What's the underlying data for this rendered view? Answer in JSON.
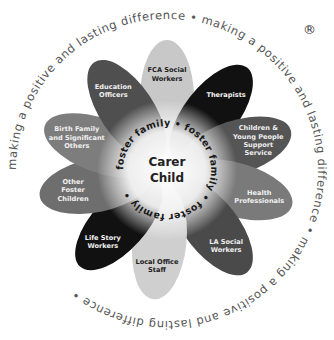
{
  "diagram": {
    "ring_text": "making a positive and lasting difference • making a positive and lasting difference • making a positive and lasting difference •",
    "inner_ring_text": "foster family • foster family • foster family •",
    "center": {
      "line1": "Carer",
      "line2": "Child"
    },
    "registered_mark": "®",
    "petals": [
      {
        "name": "fca-social-workers",
        "lines": [
          "FCA Social",
          "Workers"
        ],
        "angle": -90,
        "fill": "#c8c8c8",
        "text": "#222222"
      },
      {
        "name": "therapists",
        "lines": [
          "Therapists"
        ],
        "angle": -52,
        "fill": "#111111",
        "text": "#f0f0f0"
      },
      {
        "name": "children-young-people-support-service",
        "lines": [
          "Children &",
          "Young People",
          "Support",
          "Service"
        ],
        "angle": -18,
        "fill": "#555555",
        "text": "#eeeeee"
      },
      {
        "name": "health-professionals",
        "lines": [
          "Health",
          "Professionals"
        ],
        "angle": 16,
        "fill": "#7a7a7a",
        "text": "#f0f0f0"
      },
      {
        "name": "la-social-workers",
        "lines": [
          "LA Social",
          "Workers"
        ],
        "angle": 52,
        "fill": "#4a4a4a",
        "text": "#eeeeee"
      },
      {
        "name": "local-office-staff",
        "lines": [
          "Local Office",
          "Staff"
        ],
        "angle": 96,
        "fill": "#cfcfcf",
        "text": "#222222"
      },
      {
        "name": "life-story-workers",
        "lines": [
          "Life Story",
          "Workers"
        ],
        "angle": 132,
        "fill": "#111111",
        "text": "#f0f0f0"
      },
      {
        "name": "other-foster-children",
        "lines": [
          "Other",
          "Foster",
          "Children"
        ],
        "angle": 168,
        "fill": "#6e6e6e",
        "text": "#f0f0f0"
      },
      {
        "name": "birth-family-significant-others",
        "lines": [
          "Birth Family",
          "and Significant",
          "Others"
        ],
        "angle": -160,
        "fill": "#7d7d7d",
        "text": "#f0f0f0"
      },
      {
        "name": "education-officers",
        "lines": [
          "Education",
          "Officers"
        ],
        "angle": -124,
        "fill": "#4f4f4f",
        "text": "#eeeeee"
      }
    ]
  }
}
